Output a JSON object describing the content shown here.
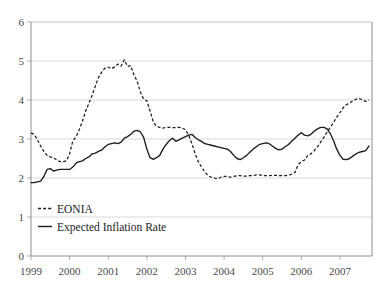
{
  "chart_data": {
    "type": "line",
    "title": "",
    "subtitle": "",
    "xlabel": "",
    "ylabel": "",
    "ylim": [
      0,
      6
    ],
    "yticks": [
      0,
      1,
      2,
      3,
      4,
      5,
      6
    ],
    "ytick_labels": [
      "0",
      "1",
      "2",
      "3",
      "4",
      "5",
      "6"
    ],
    "xlim": [
      1999.0,
      2007.83
    ],
    "xticks": [
      1999,
      2000,
      2001,
      2002,
      2003,
      2004,
      2005,
      2006,
      2007
    ],
    "xtick_labels": [
      "1999",
      "2000",
      "2001",
      "2002",
      "2003",
      "2004",
      "2005",
      "2006",
      "2007"
    ],
    "grid": "horizontal",
    "legend_position": "lower-left-inside",
    "legend": [
      {
        "name": "EONIA",
        "style": "dashed"
      },
      {
        "name": "Expected Inflation Rate",
        "style": "solid"
      }
    ],
    "x": [
      1999.0,
      1999.083,
      1999.167,
      1999.25,
      1999.333,
      1999.417,
      1999.5,
      1999.583,
      1999.667,
      1999.75,
      1999.833,
      1999.917,
      2000.0,
      2000.083,
      2000.167,
      2000.25,
      2000.333,
      2000.417,
      2000.5,
      2000.583,
      2000.667,
      2000.75,
      2000.833,
      2000.917,
      2001.0,
      2001.083,
      2001.167,
      2001.25,
      2001.333,
      2001.417,
      2001.5,
      2001.583,
      2001.667,
      2001.75,
      2001.833,
      2001.917,
      2002.0,
      2002.083,
      2002.167,
      2002.25,
      2002.333,
      2002.417,
      2002.5,
      2002.583,
      2002.667,
      2002.75,
      2002.833,
      2002.917,
      2003.0,
      2003.083,
      2003.167,
      2003.25,
      2003.333,
      2003.417,
      2003.5,
      2003.583,
      2003.667,
      2003.75,
      2003.833,
      2003.917,
      2004.0,
      2004.083,
      2004.167,
      2004.25,
      2004.333,
      2004.417,
      2004.5,
      2004.583,
      2004.667,
      2004.75,
      2004.833,
      2004.917,
      2005.0,
      2005.083,
      2005.167,
      2005.25,
      2005.333,
      2005.417,
      2005.5,
      2005.583,
      2005.667,
      2005.75,
      2005.833,
      2005.917,
      2006.0,
      2006.083,
      2006.167,
      2006.25,
      2006.333,
      2006.417,
      2006.5,
      2006.583,
      2006.667,
      2006.75,
      2006.833,
      2006.917,
      2007.0,
      2007.083,
      2007.167,
      2007.25,
      2007.333,
      2007.417,
      2007.5,
      2007.583,
      2007.667,
      2007.75
    ],
    "series": [
      {
        "name": "EONIA",
        "style": "dashed",
        "color": "#1c1c1c",
        "values": [
          3.15,
          3.12,
          2.98,
          2.82,
          2.68,
          2.58,
          2.54,
          2.52,
          2.46,
          2.42,
          2.42,
          2.44,
          2.62,
          2.95,
          3.06,
          3.24,
          3.46,
          3.72,
          3.92,
          4.12,
          4.36,
          4.58,
          4.72,
          4.82,
          4.84,
          4.8,
          4.85,
          4.92,
          4.87,
          5.03,
          4.86,
          4.88,
          4.64,
          4.48,
          4.2,
          4.02,
          3.98,
          3.72,
          3.44,
          3.32,
          3.3,
          3.28,
          3.3,
          3.3,
          3.29,
          3.29,
          3.3,
          3.28,
          3.24,
          3.1,
          2.88,
          2.62,
          2.42,
          2.28,
          2.16,
          2.06,
          2.02,
          2.0,
          1.98,
          2.02,
          2.04,
          2.04,
          2.02,
          2.04,
          2.06,
          2.06,
          2.05,
          2.05,
          2.06,
          2.06,
          2.08,
          2.08,
          2.06,
          2.06,
          2.06,
          2.07,
          2.07,
          2.06,
          2.06,
          2.06,
          2.07,
          2.1,
          2.14,
          2.34,
          2.42,
          2.46,
          2.58,
          2.62,
          2.7,
          2.8,
          2.92,
          3.04,
          3.18,
          3.3,
          3.42,
          3.56,
          3.68,
          3.8,
          3.88,
          3.92,
          3.98,
          4.02,
          4.04,
          4.0,
          3.96,
          4.0
        ]
      },
      {
        "name": "Expected Inflation Rate",
        "style": "solid",
        "color": "#1c1c1c",
        "values": [
          1.88,
          1.88,
          1.9,
          1.92,
          2.04,
          2.22,
          2.24,
          2.18,
          2.2,
          2.22,
          2.22,
          2.22,
          2.22,
          2.28,
          2.38,
          2.42,
          2.44,
          2.5,
          2.54,
          2.62,
          2.64,
          2.68,
          2.72,
          2.8,
          2.86,
          2.88,
          2.9,
          2.88,
          2.92,
          3.02,
          3.06,
          3.12,
          3.2,
          3.22,
          3.18,
          3.04,
          2.74,
          2.52,
          2.48,
          2.52,
          2.58,
          2.74,
          2.86,
          2.96,
          3.02,
          2.94,
          2.98,
          3.02,
          3.06,
          3.1,
          3.12,
          3.04,
          2.98,
          2.94,
          2.88,
          2.86,
          2.84,
          2.82,
          2.8,
          2.78,
          2.76,
          2.74,
          2.68,
          2.58,
          2.5,
          2.47,
          2.52,
          2.58,
          2.66,
          2.74,
          2.8,
          2.86,
          2.88,
          2.9,
          2.88,
          2.82,
          2.76,
          2.72,
          2.74,
          2.8,
          2.86,
          2.94,
          3.02,
          3.1,
          3.16,
          3.1,
          3.08,
          3.12,
          3.2,
          3.26,
          3.3,
          3.3,
          3.26,
          3.14,
          2.96,
          2.74,
          2.58,
          2.48,
          2.47,
          2.5,
          2.56,
          2.62,
          2.66,
          2.68,
          2.7,
          2.82
        ]
      }
    ]
  }
}
